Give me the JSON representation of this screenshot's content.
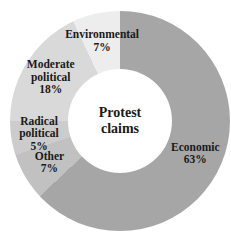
{
  "chart_data": {
    "type": "pie",
    "variant": "donut",
    "title": "Protest claims",
    "center_label_lines": [
      "Protest",
      "claims"
    ],
    "legend": "none",
    "start_angle_deg": 0,
    "direction": "clockwise",
    "unit": "%",
    "slices": [
      {
        "label": "Economic",
        "value": 63,
        "color": "#a6a6a6",
        "label_lines": [
          "Economic",
          "63%"
        ]
      },
      {
        "label": "Other",
        "value": 7,
        "color": "#c1c1c1",
        "label_lines": [
          "Other",
          "7%"
        ]
      },
      {
        "label": "Radical political",
        "value": 5,
        "color": "#cccccc",
        "label_lines": [
          "Radical",
          "political",
          "5%"
        ]
      },
      {
        "label": "Moderate political",
        "value": 18,
        "color": "#d9d9d9",
        "label_lines": [
          "Moderate",
          "political",
          "18%"
        ]
      },
      {
        "label": "Environmental",
        "value": 7,
        "color": "#ededed",
        "label_lines": [
          "Environmental",
          "7%"
        ]
      }
    ],
    "text_color": "#1a1a1a",
    "background_color": "#ffffff"
  }
}
